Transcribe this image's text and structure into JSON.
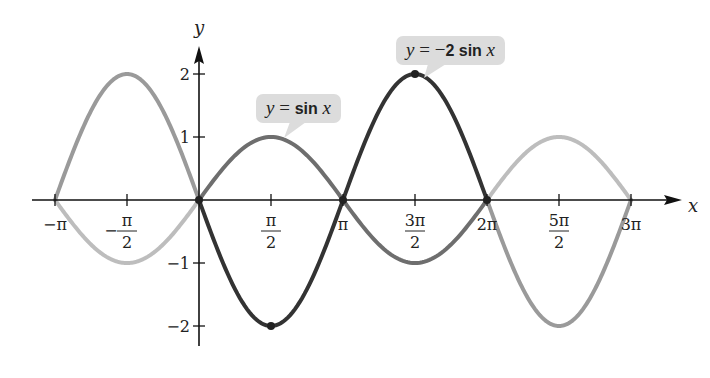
{
  "chart_data": {
    "type": "line",
    "title": "",
    "xlabel": "x",
    "ylabel": "y",
    "xlim": [
      -3.14159,
      9.42478
    ],
    "ylim": [
      -2.4,
      2.6
    ],
    "grid": false,
    "legend_position": "callouts",
    "x_ticks": [
      {
        "value": -3.14159,
        "label": "−π"
      },
      {
        "value": -1.5708,
        "label_num": "π",
        "label_den": "2",
        "sign": "−"
      },
      {
        "value": 1.5708,
        "label_num": "π",
        "label_den": "2",
        "sign": ""
      },
      {
        "value": 3.14159,
        "label": "π"
      },
      {
        "value": 4.71239,
        "label_num": "3π",
        "label_den": "2",
        "sign": ""
      },
      {
        "value": 6.28319,
        "label": "2π"
      },
      {
        "value": 7.85398,
        "label_num": "5π",
        "label_den": "2",
        "sign": ""
      },
      {
        "value": 9.42478,
        "label": "3π"
      }
    ],
    "y_ticks": [
      {
        "value": 2,
        "label": "2"
      },
      {
        "value": 1,
        "label": "1"
      },
      {
        "value": -1,
        "label": "−1"
      },
      {
        "value": -2,
        "label": "−2"
      }
    ],
    "series": [
      {
        "name": "y = sin x",
        "function": "sin",
        "amplitude": 1,
        "x": [
          -3.14159,
          -1.5708,
          0,
          1.5708,
          3.14159,
          4.71239,
          6.28319,
          7.85398,
          9.42478
        ],
        "values": [
          0,
          -1,
          0,
          1,
          0,
          -1,
          0,
          1,
          0
        ],
        "highlight_interval": [
          0,
          6.28319
        ],
        "color_main": "#6e6e6e",
        "color_extension": "#bdbdbd"
      },
      {
        "name": "y = −2 sin x",
        "function": "sin",
        "amplitude": -2,
        "x": [
          -3.14159,
          -1.5708,
          0,
          1.5708,
          3.14159,
          4.71239,
          6.28319,
          7.85398,
          9.42478
        ],
        "values": [
          0,
          2,
          0,
          -2,
          0,
          2,
          0,
          -2,
          0
        ],
        "highlight_interval": [
          0,
          6.28319
        ],
        "color_main": "#333333",
        "color_extension": "#9a9a9a"
      }
    ],
    "marked_points": [
      {
        "x": 0,
        "y": 0
      },
      {
        "x": 1.5708,
        "y": -2
      },
      {
        "x": 3.14159,
        "y": 0
      },
      {
        "x": 4.71239,
        "y": 2
      },
      {
        "x": 6.28319,
        "y": 0
      }
    ],
    "annotations": [
      {
        "text": "y = sin x",
        "points_to": {
          "x": 1.5708,
          "y": 1
        }
      },
      {
        "text": "y = −2 sin x",
        "points_to": {
          "x": 4.71239,
          "y": 2
        }
      }
    ]
  },
  "labels": {
    "x_axis": "x",
    "y_axis": "y",
    "callout_sin": {
      "y": "y",
      "eq": " = ",
      "fn": "sin",
      "x": " x"
    },
    "callout_neg2sin": {
      "y": "y",
      "eq": " = −",
      "coef": "2",
      "fn": " sin",
      "x": " x"
    }
  }
}
